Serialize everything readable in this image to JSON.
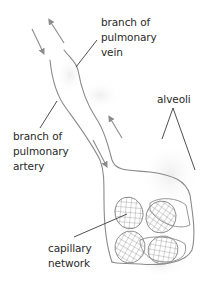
{
  "diagram": {
    "labels": {
      "vein": [
        "branch of",
        "pulmonary",
        "vein"
      ],
      "artery": [
        "branch of",
        "pulmonary",
        "artery"
      ],
      "alveoli": [
        "alveoli"
      ],
      "capillary": [
        "capillary",
        "network"
      ]
    },
    "colors": {
      "outline": "#8a8a8a",
      "arrow": "#8c8c8c",
      "leader": "#3a3a3a",
      "shade": "#ececec",
      "text": "#2a2a2a"
    }
  }
}
